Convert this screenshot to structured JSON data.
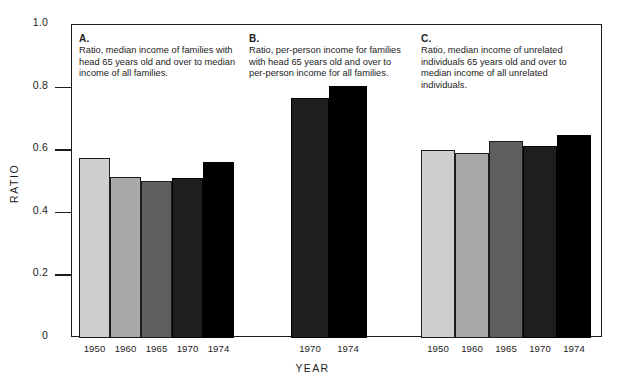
{
  "figure": {
    "ylabel": "RATIO",
    "xlabel": "YEAR",
    "yticks": [
      "1.0",
      "0.8",
      "0.6",
      "0.4",
      "0.2",
      "0"
    ]
  },
  "panels": [
    {
      "letter": "A.",
      "caption": "Ratio, median income of families with head 65 years old and over to median income of all families."
    },
    {
      "letter": "B.",
      "caption": "Ratio, per-person income for families with head 65 years old and over to per-person income for all families."
    },
    {
      "letter": "C.",
      "caption": "Ratio, median income of unrelated individuals 65 years old and over to median income of all unrelated individuals."
    }
  ],
  "colors": {
    "shade_1950": "#cfcfcf",
    "shade_1960": "#a9a9a9",
    "shade_1965": "#5e5e5e",
    "shade_1970": "#1e1e1e",
    "shade_1974": "#000000",
    "axis": "#1c1c1c",
    "background": "#ffffff"
  },
  "chart_data": [
    {
      "type": "bar",
      "title": "A.",
      "subtitle": "Ratio, median income of families with head 65 years old and over to median income of all families.",
      "xlabel": "YEAR",
      "ylabel": "RATIO",
      "ylim": [
        0,
        1.0
      ],
      "yticks": [
        0,
        0.2,
        0.4,
        0.6,
        0.8,
        1.0
      ],
      "grid": false,
      "legend": "none",
      "categories": [
        "1950",
        "1960",
        "1965",
        "1970",
        "1974"
      ],
      "values": [
        0.575,
        0.515,
        0.503,
        0.512,
        0.562
      ]
    },
    {
      "type": "bar",
      "title": "B.",
      "subtitle": "Ratio, per-person income for families with head 65 years old and over to per-person income for all families.",
      "xlabel": "YEAR",
      "ylabel": "RATIO",
      "ylim": [
        0,
        1.0
      ],
      "yticks": [
        0,
        0.2,
        0.4,
        0.6,
        0.8,
        1.0
      ],
      "grid": false,
      "legend": "none",
      "categories": [
        "1970",
        "1974"
      ],
      "values": [
        0.768,
        0.805
      ]
    },
    {
      "type": "bar",
      "title": "C.",
      "subtitle": "Ratio, median income of unrelated individuals 65 years old and over to median income of all unrelated individuals.",
      "xlabel": "YEAR",
      "ylabel": "RATIO",
      "ylim": [
        0,
        1.0
      ],
      "yticks": [
        0,
        0.2,
        0.4,
        0.6,
        0.8,
        1.0
      ],
      "grid": false,
      "legend": "none",
      "categories": [
        "1950",
        "1960",
        "1965",
        "1970",
        "1974"
      ],
      "values": [
        0.601,
        0.592,
        0.628,
        0.613,
        0.65
      ]
    }
  ],
  "layout": {
    "plot": {
      "left": 71,
      "top": 24,
      "width": 531,
      "height": 313
    },
    "panel_geometry": [
      {
        "left": 78,
        "caption_width": 160,
        "bar_width": 31,
        "bar_gap": 0,
        "n": 5
      },
      {
        "left": 248,
        "caption_width": 160,
        "bar_width": 38,
        "bar_gap": 0,
        "n": 2,
        "bars_offset": 42
      },
      {
        "left": 420,
        "caption_width": 175,
        "bar_width": 34,
        "bar_gap": 0,
        "n": 5
      }
    ]
  }
}
